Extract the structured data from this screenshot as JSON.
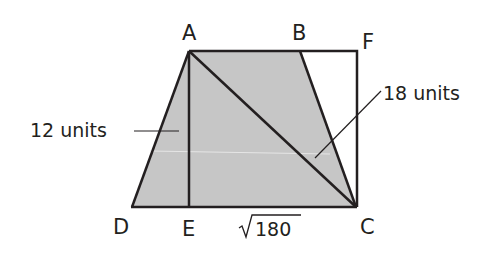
{
  "diagram": {
    "type": "geometry",
    "colors": {
      "fill": "#c6c6c6",
      "stroke": "#231f20",
      "background": "#ffffff"
    },
    "points": {
      "A": {
        "label": "A",
        "x": 189,
        "y": 51
      },
      "B": {
        "label": "B",
        "x": 300,
        "y": 51
      },
      "F": {
        "label": "F",
        "x": 357,
        "y": 51
      },
      "C": {
        "label": "C",
        "x": 355,
        "y": 207
      },
      "D": {
        "label": "D",
        "x": 132,
        "y": 207
      },
      "E": {
        "label": "E",
        "x": 189,
        "y": 207
      }
    },
    "segments": [
      "AB",
      "BF",
      "FC",
      "CE",
      "ED",
      "DA",
      "AE",
      "AC",
      "BC"
    ],
    "shaded_region": "ABCD",
    "measures": {
      "AE": "12 units",
      "AC": "18 units",
      "EC": "180"
    },
    "labels": {
      "A": "A",
      "B": "B",
      "F": "F",
      "C": "C",
      "D": "D",
      "E": "E",
      "ae_length": "12 units",
      "ac_length": "18 units",
      "ec_length_radicand": "180"
    }
  }
}
